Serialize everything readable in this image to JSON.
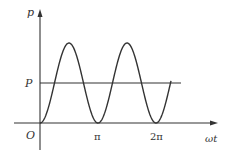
{
  "chart_data": {
    "type": "line",
    "title": "",
    "xlabel": "ωt",
    "ylabel": "p",
    "origin_label": "O",
    "x_ticks": [
      {
        "value": 3.14159,
        "label": "π"
      },
      {
        "value": 6.28318,
        "label": "2π"
      }
    ],
    "y_ticks": [
      {
        "value": 1,
        "label": "P"
      }
    ],
    "series": [
      {
        "name": "p(ωt) = P(1 - cos 2ωt)",
        "x": [
          0,
          0.785,
          1.571,
          2.356,
          3.142,
          3.927,
          4.712,
          5.498,
          6.283,
          7.069
        ],
        "values": [
          0,
          1,
          2,
          1,
          0,
          1,
          2,
          1,
          0,
          1
        ]
      },
      {
        "name": "average power P",
        "x": [
          0,
          7.4
        ],
        "values": [
          1,
          1
        ]
      }
    ],
    "xlim": [
      0,
      8.3
    ],
    "ylim": [
      0,
      2.6
    ],
    "grid": false,
    "legend": null,
    "colors": {
      "curve": "#333333",
      "axes": "#333333"
    }
  }
}
